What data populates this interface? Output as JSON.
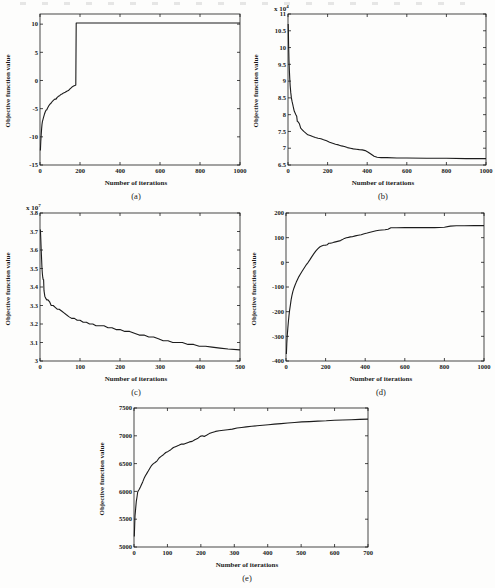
{
  "page": {
    "background": "#fdfdfc",
    "line_color": "#1c1c1c",
    "axis_color": "#1a1a1a"
  },
  "chart_data": [
    {
      "id": "a",
      "type": "line",
      "caption": "(a)",
      "xlabel": "Number of iterations",
      "ylabel": "Objective function value",
      "exp_label": "",
      "exp_sup": "",
      "xlim": [
        0,
        1000
      ],
      "ylim": [
        -15,
        11.8
      ],
      "xticks": [
        0,
        200,
        400,
        600,
        800,
        1000
      ],
      "xtick_labels": [
        "0",
        "200",
        "400",
        "600",
        "800",
        "1000"
      ],
      "yticks": [
        -15,
        -10,
        -5,
        0,
        5,
        10
      ],
      "ytick_labels": [
        "-15",
        "-10",
        "-5",
        "0",
        "5",
        "10"
      ],
      "grid": false,
      "legend": null,
      "points": [
        [
          2,
          -12.4
        ],
        [
          3,
          -11.6
        ],
        [
          4,
          -10.8
        ],
        [
          5,
          -10.2
        ],
        [
          6,
          -9.6
        ],
        [
          8,
          -8.6
        ],
        [
          10,
          -7.8
        ],
        [
          12,
          -7.3
        ],
        [
          15,
          -6.9
        ],
        [
          18,
          -6.5
        ],
        [
          22,
          -6.0
        ],
        [
          26,
          -5.6
        ],
        [
          30,
          -5.3
        ],
        [
          34,
          -5.2
        ],
        [
          38,
          -4.9
        ],
        [
          44,
          -4.5
        ],
        [
          50,
          -4.2
        ],
        [
          56,
          -4.0
        ],
        [
          62,
          -3.7
        ],
        [
          68,
          -3.5
        ],
        [
          74,
          -3.3
        ],
        [
          80,
          -3.3
        ],
        [
          86,
          -3.0
        ],
        [
          92,
          -2.8
        ],
        [
          98,
          -2.7
        ],
        [
          104,
          -2.5
        ],
        [
          110,
          -2.4
        ],
        [
          118,
          -2.2
        ],
        [
          126,
          -2.1
        ],
        [
          134,
          -1.9
        ],
        [
          142,
          -1.8
        ],
        [
          150,
          -1.5
        ],
        [
          156,
          -1.3
        ],
        [
          162,
          -1.1
        ],
        [
          168,
          -1.0
        ],
        [
          174,
          -0.9
        ],
        [
          179,
          -0.8
        ],
        [
          181,
          10.2
        ],
        [
          1000,
          10.2
        ]
      ]
    },
    {
      "id": "b",
      "type": "line",
      "caption": "(b)",
      "xlabel": "Number of iterations",
      "ylabel": "Objective function value",
      "exp_label": "x 10",
      "exp_sup": "4",
      "xlim": [
        0,
        1000
      ],
      "ylim": [
        6.5,
        11
      ],
      "xticks": [
        0,
        200,
        400,
        600,
        800,
        1000
      ],
      "xtick_labels": [
        "0",
        "200",
        "400",
        "600",
        "800",
        "1000"
      ],
      "yticks": [
        6.5,
        7,
        7.5,
        8,
        8.5,
        9,
        9.5,
        10,
        10.5,
        11
      ],
      "ytick_labels": [
        "6.5",
        "7",
        "7.5",
        "8",
        "8.5",
        "9",
        "9.5",
        "10",
        "10.5",
        "11"
      ],
      "grid": false,
      "legend": null,
      "points": [
        [
          1,
          10.7
        ],
        [
          2,
          10.45
        ],
        [
          3,
          10.1
        ],
        [
          4,
          9.85
        ],
        [
          5,
          9.6
        ],
        [
          7,
          9.3
        ],
        [
          9,
          9.05
        ],
        [
          11,
          8.85
        ],
        [
          14,
          8.65
        ],
        [
          17,
          8.5
        ],
        [
          20,
          8.4
        ],
        [
          24,
          8.3
        ],
        [
          28,
          8.2
        ],
        [
          32,
          8.1
        ],
        [
          36,
          8.05
        ],
        [
          40,
          8.0
        ],
        [
          44,
          7.95
        ],
        [
          47,
          7.8
        ],
        [
          52,
          7.78
        ],
        [
          58,
          7.72
        ],
        [
          64,
          7.6
        ],
        [
          72,
          7.55
        ],
        [
          80,
          7.5
        ],
        [
          90,
          7.45
        ],
        [
          100,
          7.4
        ],
        [
          112,
          7.38
        ],
        [
          124,
          7.35
        ],
        [
          138,
          7.32
        ],
        [
          152,
          7.3
        ],
        [
          166,
          7.28
        ],
        [
          180,
          7.25
        ],
        [
          195,
          7.22
        ],
        [
          210,
          7.18
        ],
        [
          225,
          7.15
        ],
        [
          240,
          7.12
        ],
        [
          255,
          7.1
        ],
        [
          270,
          7.07
        ],
        [
          285,
          7.05
        ],
        [
          300,
          7.02
        ],
        [
          315,
          7.0
        ],
        [
          330,
          6.98
        ],
        [
          345,
          6.97
        ],
        [
          360,
          6.96
        ],
        [
          375,
          6.95
        ],
        [
          390,
          6.93
        ],
        [
          405,
          6.88
        ],
        [
          420,
          6.82
        ],
        [
          435,
          6.76
        ],
        [
          450,
          6.73
        ],
        [
          470,
          6.72
        ],
        [
          500,
          6.72
        ],
        [
          550,
          6.71
        ],
        [
          600,
          6.71
        ],
        [
          700,
          6.7
        ],
        [
          800,
          6.7
        ],
        [
          900,
          6.69
        ],
        [
          1000,
          6.69
        ]
      ]
    },
    {
      "id": "c",
      "type": "line",
      "caption": "(c)",
      "xlabel": "Number of iterations",
      "ylabel": "Objective function value",
      "exp_label": "x 10",
      "exp_sup": "7",
      "xlim": [
        0,
        500
      ],
      "ylim": [
        3,
        3.8
      ],
      "xticks": [
        0,
        100,
        200,
        300,
        400,
        500
      ],
      "xtick_labels": [
        "0",
        "100",
        "200",
        "300",
        "400",
        "500"
      ],
      "yticks": [
        3,
        3.1,
        3.2,
        3.3,
        3.4,
        3.5,
        3.6,
        3.7,
        3.8
      ],
      "ytick_labels": [
        "3",
        "3.1",
        "3.2",
        "3.3",
        "3.4",
        "3.5",
        "3.6",
        "3.7",
        "3.8"
      ],
      "grid": false,
      "legend": null,
      "points": [
        [
          1,
          3.71
        ],
        [
          2,
          3.66
        ],
        [
          3,
          3.6
        ],
        [
          4,
          3.55
        ],
        [
          5,
          3.5
        ],
        [
          6,
          3.47
        ],
        [
          7,
          3.45
        ],
        [
          8,
          3.44
        ],
        [
          9,
          3.44
        ],
        [
          10,
          3.38
        ],
        [
          12,
          3.35
        ],
        [
          14,
          3.34
        ],
        [
          17,
          3.33
        ],
        [
          20,
          3.33
        ],
        [
          24,
          3.32
        ],
        [
          28,
          3.3
        ],
        [
          33,
          3.3
        ],
        [
          38,
          3.29
        ],
        [
          43,
          3.28
        ],
        [
          48,
          3.28
        ],
        [
          54,
          3.27
        ],
        [
          60,
          3.26
        ],
        [
          66,
          3.25
        ],
        [
          72,
          3.24
        ],
        [
          79,
          3.23
        ],
        [
          86,
          3.23
        ],
        [
          93,
          3.22
        ],
        [
          100,
          3.22
        ],
        [
          108,
          3.21
        ],
        [
          116,
          3.21
        ],
        [
          124,
          3.2
        ],
        [
          132,
          3.2
        ],
        [
          140,
          3.19
        ],
        [
          150,
          3.19
        ],
        [
          160,
          3.19
        ],
        [
          170,
          3.18
        ],
        [
          180,
          3.18
        ],
        [
          190,
          3.17
        ],
        [
          200,
          3.17
        ],
        [
          212,
          3.16
        ],
        [
          224,
          3.16
        ],
        [
          236,
          3.15
        ],
        [
          248,
          3.14
        ],
        [
          260,
          3.14
        ],
        [
          272,
          3.13
        ],
        [
          284,
          3.13
        ],
        [
          296,
          3.12
        ],
        [
          308,
          3.11
        ],
        [
          320,
          3.11
        ],
        [
          332,
          3.1
        ],
        [
          344,
          3.1
        ],
        [
          356,
          3.1
        ],
        [
          370,
          3.09
        ],
        [
          384,
          3.09
        ],
        [
          398,
          3.08
        ],
        [
          414,
          3.08
        ],
        [
          430,
          3.075
        ],
        [
          450,
          3.07
        ],
        [
          470,
          3.065
        ],
        [
          500,
          3.06
        ]
      ]
    },
    {
      "id": "d",
      "type": "line",
      "caption": "(d)",
      "xlabel": "Number of iterations",
      "ylabel": "Objective function value",
      "exp_label": "",
      "exp_sup": "",
      "xlim": [
        0,
        1000
      ],
      "ylim": [
        -400,
        200
      ],
      "xticks": [
        0,
        200,
        400,
        600,
        800,
        1000
      ],
      "xtick_labels": [
        "0",
        "200",
        "400",
        "600",
        "800",
        "1000"
      ],
      "yticks": [
        -400,
        -300,
        -200,
        -100,
        0,
        100,
        200
      ],
      "ytick_labels": [
        "-400",
        "-300",
        "-200",
        "-100",
        "0",
        "100",
        "200"
      ],
      "grid": false,
      "legend": null,
      "points": [
        [
          2,
          -372
        ],
        [
          4,
          -330
        ],
        [
          6,
          -300
        ],
        [
          9,
          -268
        ],
        [
          12,
          -240
        ],
        [
          15,
          -215
        ],
        [
          18,
          -195
        ],
        [
          22,
          -172
        ],
        [
          26,
          -152
        ],
        [
          30,
          -135
        ],
        [
          35,
          -118
        ],
        [
          40,
          -105
        ],
        [
          46,
          -92
        ],
        [
          52,
          -80
        ],
        [
          58,
          -70
        ],
        [
          65,
          -58
        ],
        [
          72,
          -48
        ],
        [
          80,
          -38
        ],
        [
          88,
          -28
        ],
        [
          96,
          -18
        ],
        [
          104,
          -8
        ],
        [
          112,
          0
        ],
        [
          120,
          10
        ],
        [
          130,
          22
        ],
        [
          140,
          34
        ],
        [
          150,
          45
        ],
        [
          160,
          55
        ],
        [
          170,
          62
        ],
        [
          180,
          66
        ],
        [
          190,
          69
        ],
        [
          200,
          70
        ],
        [
          208,
          71
        ],
        [
          215,
          77
        ],
        [
          225,
          78
        ],
        [
          235,
          79
        ],
        [
          245,
          82
        ],
        [
          255,
          84
        ],
        [
          265,
          86
        ],
        [
          275,
          88
        ],
        [
          285,
          92
        ],
        [
          295,
          97
        ],
        [
          305,
          100
        ],
        [
          315,
          101
        ],
        [
          325,
          103
        ],
        [
          335,
          104
        ],
        [
          350,
          107
        ],
        [
          365,
          110
        ],
        [
          380,
          112
        ],
        [
          395,
          116
        ],
        [
          410,
          119
        ],
        [
          425,
          122
        ],
        [
          440,
          125
        ],
        [
          455,
          128
        ],
        [
          470,
          130
        ],
        [
          485,
          131
        ],
        [
          500,
          132
        ],
        [
          515,
          134
        ],
        [
          530,
          140
        ],
        [
          560,
          140
        ],
        [
          600,
          141
        ],
        [
          650,
          141
        ],
        [
          700,
          141
        ],
        [
          750,
          141
        ],
        [
          800,
          142
        ],
        [
          830,
          147
        ],
        [
          860,
          148
        ],
        [
          900,
          148
        ],
        [
          950,
          149
        ],
        [
          1000,
          149
        ]
      ]
    },
    {
      "id": "e",
      "type": "line",
      "caption": "(e)",
      "xlabel": "Number of iterations",
      "ylabel": "Objective function value",
      "exp_label": "",
      "exp_sup": "",
      "xlim": [
        0,
        700
      ],
      "ylim": [
        5000,
        7500
      ],
      "xticks": [
        0,
        100,
        200,
        300,
        400,
        500,
        600,
        700
      ],
      "xtick_labels": [
        "0",
        "100",
        "200",
        "300",
        "400",
        "500",
        "600",
        "700"
      ],
      "yticks": [
        5000,
        5500,
        6000,
        6500,
        7000,
        7500
      ],
      "ytick_labels": [
        "5000",
        "5500",
        "6000",
        "6500",
        "7000",
        "7500"
      ],
      "grid": false,
      "legend": null,
      "points": [
        [
          1,
          5190
        ],
        [
          2,
          5400
        ],
        [
          3,
          5560
        ],
        [
          5,
          5700
        ],
        [
          7,
          5820
        ],
        [
          9,
          5900
        ],
        [
          11,
          5990
        ],
        [
          13,
          6010
        ],
        [
          16,
          6040
        ],
        [
          19,
          6080
        ],
        [
          22,
          6120
        ],
        [
          26,
          6170
        ],
        [
          30,
          6230
        ],
        [
          34,
          6280
        ],
        [
          38,
          6320
        ],
        [
          43,
          6370
        ],
        [
          48,
          6420
        ],
        [
          53,
          6470
        ],
        [
          58,
          6500
        ],
        [
          63,
          6520
        ],
        [
          69,
          6550
        ],
        [
          75,
          6600
        ],
        [
          81,
          6630
        ],
        [
          88,
          6660
        ],
        [
          95,
          6700
        ],
        [
          102,
          6720
        ],
        [
          110,
          6750
        ],
        [
          118,
          6790
        ],
        [
          126,
          6810
        ],
        [
          134,
          6830
        ],
        [
          142,
          6850
        ],
        [
          150,
          6850
        ],
        [
          158,
          6870
        ],
        [
          166,
          6890
        ],
        [
          174,
          6900
        ],
        [
          182,
          6930
        ],
        [
          190,
          6950
        ],
        [
          198,
          6990
        ],
        [
          204,
          7000
        ],
        [
          210,
          6990
        ],
        [
          217,
          7010
        ],
        [
          225,
          7040
        ],
        [
          234,
          7060
        ],
        [
          244,
          7080
        ],
        [
          255,
          7090
        ],
        [
          267,
          7100
        ],
        [
          280,
          7110
        ],
        [
          294,
          7120
        ],
        [
          308,
          7140
        ],
        [
          322,
          7150
        ],
        [
          336,
          7160
        ],
        [
          352,
          7170
        ],
        [
          368,
          7180
        ],
        [
          385,
          7190
        ],
        [
          402,
          7200
        ],
        [
          420,
          7210
        ],
        [
          440,
          7220
        ],
        [
          460,
          7230
        ],
        [
          480,
          7240
        ],
        [
          502,
          7250
        ],
        [
          525,
          7255
        ],
        [
          550,
          7265
        ],
        [
          575,
          7270
        ],
        [
          600,
          7280
        ],
        [
          625,
          7285
        ],
        [
          650,
          7290
        ],
        [
          675,
          7295
        ],
        [
          700,
          7300
        ]
      ]
    }
  ]
}
